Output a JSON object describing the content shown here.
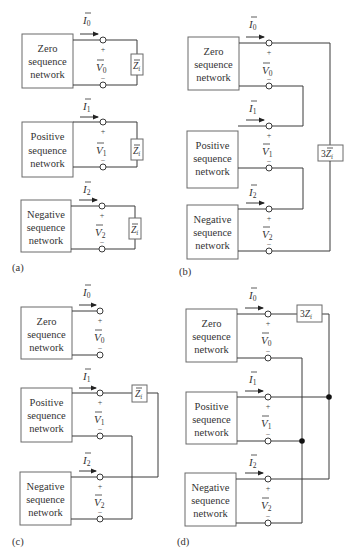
{
  "figure": {
    "panels": [
      {
        "id": "a",
        "caption": "(a)",
        "description": "Three sequence networks each terminated in Z_f (series/independent)",
        "networks": [
          {
            "line1": "Zero",
            "line2": "sequence",
            "line3": "network",
            "current": "I",
            "current_sub": "0",
            "voltage": "V",
            "voltage_sub": "0"
          },
          {
            "line1": "Positive",
            "line2": "sequence",
            "line3": "network",
            "current": "I",
            "current_sub": "1",
            "voltage": "V",
            "voltage_sub": "1"
          },
          {
            "line1": "Negative",
            "line2": "sequence",
            "line3": "network",
            "current": "I",
            "current_sub": "2",
            "voltage": "V",
            "voltage_sub": "2"
          }
        ],
        "impedances": [
          {
            "main": "Z",
            "sub": "f"
          },
          {
            "main": "Z",
            "sub": "f"
          },
          {
            "main": "Z",
            "sub": "f"
          }
        ]
      },
      {
        "id": "b",
        "caption": "(b)",
        "description": "Series connection of networks through 3Z_f",
        "networks": [
          {
            "line1": "Zero",
            "line2": "sequence",
            "line3": "network",
            "current": "I",
            "current_sub": "0",
            "voltage": "V",
            "voltage_sub": "0"
          },
          {
            "line1": "Positive",
            "line2": "sequence",
            "line3": "network",
            "current": "I",
            "current_sub": "1",
            "voltage": "V",
            "voltage_sub": "1"
          },
          {
            "line1": "Negative",
            "line2": "sequence",
            "line3": "network",
            "current": "I",
            "current_sub": "2",
            "voltage": "V",
            "voltage_sub": "2"
          }
        ],
        "impedances": [
          {
            "prefix": "3",
            "main": "Z",
            "sub": "f"
          }
        ]
      },
      {
        "id": "c",
        "caption": "(c)",
        "description": "Positive and negative networks connected through Z_f, zero open",
        "networks": [
          {
            "line1": "Zero",
            "line2": "sequence",
            "line3": "network",
            "current": "I",
            "current_sub": "0",
            "voltage": "V",
            "voltage_sub": "0"
          },
          {
            "line1": "Positive",
            "line2": "sequence",
            "line3": "network",
            "current": "I",
            "current_sub": "1",
            "voltage": "V",
            "voltage_sub": "1"
          },
          {
            "line1": "Negative",
            "line2": "sequence",
            "line3": "network",
            "current": "I",
            "current_sub": "2",
            "voltage": "V",
            "voltage_sub": "2"
          }
        ],
        "impedances": [
          {
            "main": "Z",
            "sub": "f"
          }
        ]
      },
      {
        "id": "d",
        "caption": "(d)",
        "description": "Parallel connection of networks, zero through 3Z_f",
        "networks": [
          {
            "line1": "Zero",
            "line2": "sequence",
            "line3": "network",
            "current": "I",
            "current_sub": "0",
            "voltage": "V",
            "voltage_sub": "0"
          },
          {
            "line1": "Positive",
            "line2": "sequence",
            "line3": "network",
            "current": "I",
            "current_sub": "1",
            "voltage": "V",
            "voltage_sub": "1"
          },
          {
            "line1": "Negative",
            "line2": "sequence",
            "line3": "network",
            "current": "I",
            "current_sub": "2",
            "voltage": "V",
            "voltage_sub": "2"
          }
        ],
        "impedances": [
          {
            "prefix": "3",
            "main": "Z",
            "sub": "f"
          }
        ]
      }
    ],
    "signs": {
      "plus": "+",
      "minus": "−"
    }
  }
}
